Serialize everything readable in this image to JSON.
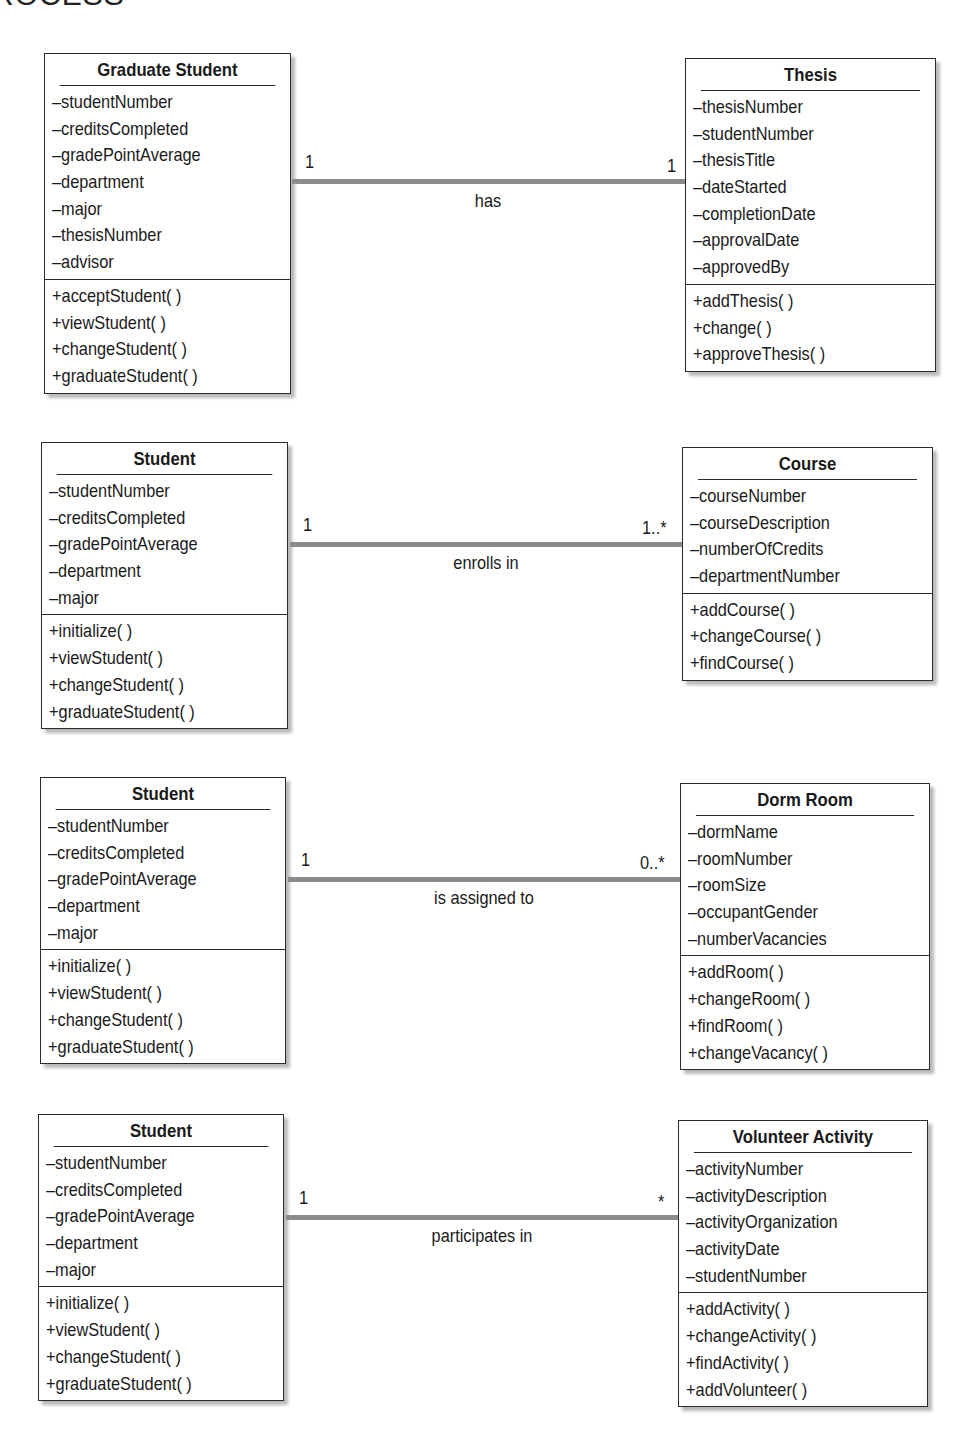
{
  "page_header_fragment": "ROCESS",
  "associations": [
    {
      "left": {
        "name": "Graduate Student",
        "attributes": [
          "–studentNumber",
          "–creditsCompleted",
          "–gradePointAverage",
          "–department",
          "–major",
          "–thesisNumber",
          "–advisor"
        ],
        "methods": [
          "+acceptStudent( )",
          "+viewStudent( )",
          "+changeStudent( )",
          "+graduateStudent( )"
        ]
      },
      "right": {
        "name": "Thesis",
        "attributes": [
          "–thesisNumber",
          "–studentNumber",
          "–thesisTitle",
          "–dateStarted",
          "–completionDate",
          "–approvalDate",
          "–approvedBy"
        ],
        "methods": [
          "+addThesis( )",
          "+change( )",
          "+approveThesis( )"
        ]
      },
      "left_multiplicity": "1",
      "right_multiplicity": "1",
      "label": "has"
    },
    {
      "left": {
        "name": "Student",
        "attributes": [
          "–studentNumber",
          "–creditsCompleted",
          "–gradePointAverage",
          "–department",
          "–major"
        ],
        "methods": [
          "+initialize( )",
          "+viewStudent( )",
          "+changeStudent( )",
          "+graduateStudent( )"
        ]
      },
      "right": {
        "name": "Course",
        "attributes": [
          "–courseNumber",
          "–courseDescription",
          "–numberOfCredits",
          "–departmentNumber"
        ],
        "methods": [
          "+addCourse( )",
          "+changeCourse( )",
          "+findCourse( )"
        ]
      },
      "left_multiplicity": "1",
      "right_multiplicity": "1..*",
      "label": "enrolls in"
    },
    {
      "left": {
        "name": "Student",
        "attributes": [
          "–studentNumber",
          "–creditsCompleted",
          "–gradePointAverage",
          "–department",
          "–major"
        ],
        "methods": [
          "+initialize( )",
          "+viewStudent( )",
          "+changeStudent( )",
          "+graduateStudent( )"
        ]
      },
      "right": {
        "name": "Dorm Room",
        "attributes": [
          "–dormName",
          "–roomNumber",
          "–roomSize",
          "–occupantGender",
          "–numberVacancies"
        ],
        "methods": [
          "+addRoom( )",
          "+changeRoom( )",
          "+findRoom( )",
          "+changeVacancy( )"
        ]
      },
      "left_multiplicity": "1",
      "right_multiplicity": "0..*",
      "label": "is assigned to"
    },
    {
      "left": {
        "name": "Student",
        "attributes": [
          "–studentNumber",
          "–creditsCompleted",
          "–gradePointAverage",
          "–department",
          "–major"
        ],
        "methods": [
          "+initialize( )",
          "+viewStudent( )",
          "+changeStudent( )",
          "+graduateStudent( )"
        ]
      },
      "right": {
        "name": "Volunteer Activity",
        "attributes": [
          "–activityNumber",
          "–activityDescription",
          "–activityOrganization",
          "–activityDate",
          "–studentNumber"
        ],
        "methods": [
          "+addActivity( )",
          "+changeActivity( )",
          "+findActivity( )",
          "+addVolunteer( )"
        ]
      },
      "left_multiplicity": "1",
      "right_multiplicity": "*",
      "label": "participates in"
    }
  ]
}
